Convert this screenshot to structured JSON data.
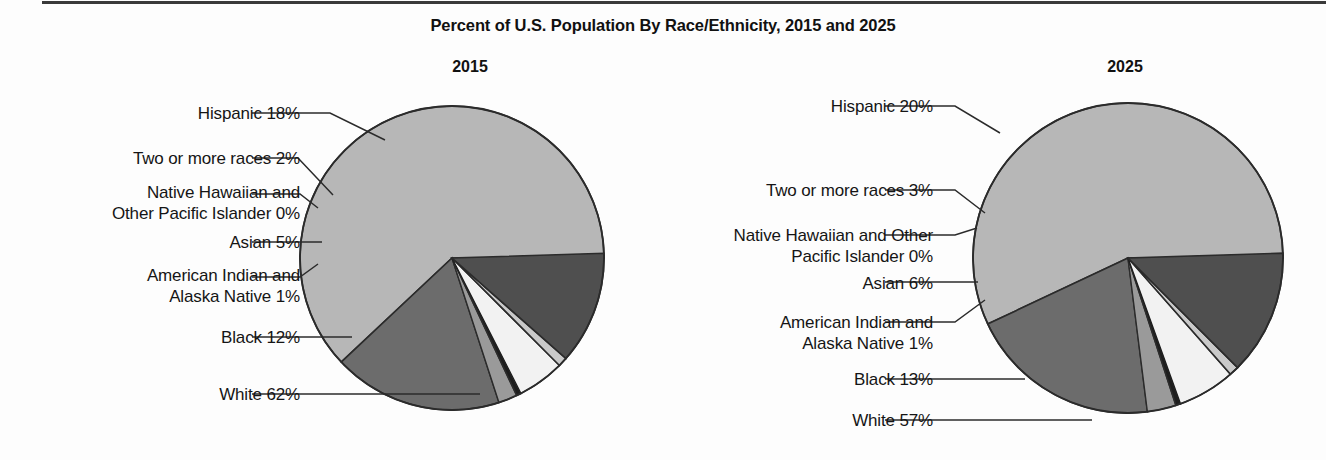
{
  "title": "Percent of U.S. Population By Race/Ethnicity, 2015 and 2025",
  "charts": [
    {
      "year": "2015",
      "labels": {
        "hispanic": "Hispanic 18%",
        "tworaces": "Two or more races 2%",
        "nhopi": "Native Hawaiian and\nOther Pacific Islander 0%",
        "asian": "Asian 5%",
        "aian": "American Indian and\nAlaska Native 1%",
        "black": "Black 12%",
        "white": "White 62%"
      }
    },
    {
      "year": "2025",
      "labels": {
        "hispanic": "Hispanic 20%",
        "tworaces": "Two or more races 3%",
        "nhopi": "Native Hawaiian and Other\nPacific Islander 0%",
        "asian": "Asian 6%",
        "aian": "American Indian and\nAlaska Native 1%",
        "black": "Black 13%",
        "white": "White 57%"
      }
    }
  ],
  "chart_data": [
    {
      "type": "pie",
      "title": "2015",
      "categories": [
        "White",
        "Hispanic",
        "Two or more races",
        "Native Hawaiian and Other Pacific Islander",
        "Asian",
        "American Indian and Alaska Native",
        "Black"
      ],
      "values": [
        62,
        18,
        2,
        0,
        5,
        1,
        12
      ],
      "unit": "percent",
      "colors": [
        "#b7b7b7",
        "#6c6c6c",
        "#9a9a9a",
        "#1d1d1d",
        "#f2f2f2",
        "#c9c9c9",
        "#4f4f4f"
      ],
      "legend": "none",
      "start_angle_deg": 0,
      "direction": "counterclockwise"
    },
    {
      "type": "pie",
      "title": "2025",
      "categories": [
        "White",
        "Hispanic",
        "Two or more races",
        "Native Hawaiian and Other Pacific Islander",
        "Asian",
        "American Indian and Alaska Native",
        "Black"
      ],
      "values": [
        57,
        20,
        3,
        0,
        6,
        1,
        13
      ],
      "unit": "percent",
      "colors": [
        "#b7b7b7",
        "#6c6c6c",
        "#9a9a9a",
        "#1d1d1d",
        "#f2f2f2",
        "#c9c9c9",
        "#4f4f4f"
      ],
      "legend": "none",
      "start_angle_deg": 0,
      "direction": "counterclockwise"
    }
  ]
}
